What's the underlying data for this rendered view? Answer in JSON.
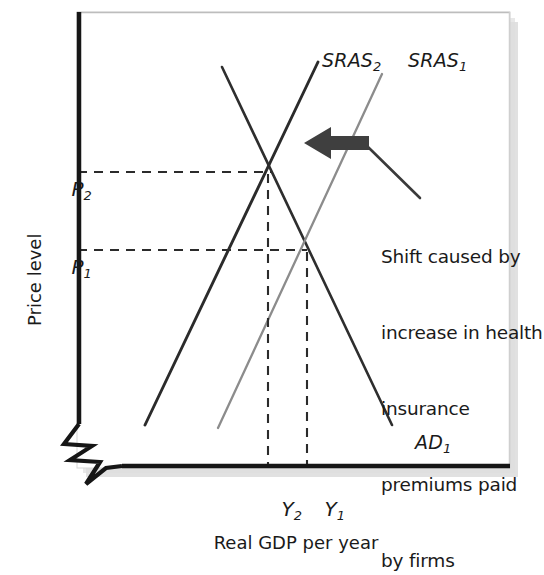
{
  "figure": {
    "background": "#ffffff",
    "panel": {
      "x": 77,
      "y": 12,
      "width": 433,
      "height": 456,
      "fill": "#ffffff"
    },
    "axis_color": "#161616",
    "shadow_color": "#b9b9b9"
  },
  "axes": {
    "y_title": "Price level",
    "x_title": "Real GDP per year",
    "y_ticks": [
      {
        "id": "P2",
        "base": "P",
        "sub": "2",
        "value_y": 172
      },
      {
        "id": "P1",
        "base": "P",
        "sub": "1",
        "value_y": 250
      }
    ],
    "x_ticks": [
      {
        "id": "Y2",
        "base": "Y",
        "sub": "2",
        "value_x": 268
      },
      {
        "id": "Y1",
        "base": "Y",
        "sub": "1",
        "value_x": 307
      }
    ],
    "break_symbol": "zigzag-axis-break"
  },
  "curves": [
    {
      "id": "AD1",
      "base": "AD",
      "sub": "1",
      "label": "AD1",
      "type": "aggregate-demand",
      "slope": "downward",
      "color": "#2e2e2e",
      "stroke_width": 2.6,
      "x1": 222,
      "y1": 67,
      "x2": 392,
      "y2": 425,
      "label_x": 392,
      "label_y": 436
    },
    {
      "id": "SRAS2",
      "base": "SRAS",
      "sub": "2",
      "label": "SRAS2",
      "type": "short-run-aggregate-supply",
      "slope": "upward",
      "color": "#2b2b2b",
      "stroke_width": 2.9,
      "x1": 145,
      "y1": 425,
      "x2": 318,
      "y2": 62,
      "label_x": 297,
      "label_y": 50
    },
    {
      "id": "SRAS1",
      "base": "SRAS",
      "sub": "1",
      "label": "SRAS1",
      "type": "short-run-aggregate-supply",
      "slope": "upward",
      "color": "#8c8c8c",
      "stroke_width": 2.3,
      "x1": 218,
      "y1": 428,
      "x2": 382,
      "y2": 74,
      "label_x": 383,
      "label_y": 50
    }
  ],
  "equilibria": [
    {
      "id": "E2",
      "x": 271,
      "y": 172,
      "price_label": "P2",
      "output_label": "Y2"
    },
    {
      "id": "E1",
      "x": 307,
      "y": 250,
      "price_label": "P1",
      "output_label": "Y1"
    }
  ],
  "guides": {
    "color": "#2b2b2b",
    "dash": "9,7",
    "horizontal": [
      {
        "from_x": 78,
        "to_x": 271,
        "y": 172
      },
      {
        "from_x": 78,
        "to_x": 307,
        "y": 250
      }
    ],
    "vertical": [
      {
        "x": 268,
        "from_y": 172,
        "to_y": 468
      },
      {
        "x": 307,
        "from_y": 250,
        "to_y": 468
      }
    ]
  },
  "annotation": {
    "arrow": {
      "name": "shift-arrow",
      "direction": "left",
      "color": "#3a3a3a",
      "tail_x": 368,
      "head_x": 304,
      "y": 143
    },
    "leader_line": {
      "x1": 368,
      "y1": 145,
      "x2": 419,
      "y2": 196,
      "color": "#3a3a3a"
    },
    "text_lines": [
      "Shift caused by",
      "increase in health",
      "insurance",
      "premiums paid",
      "by firms"
    ],
    "text_x": 381,
    "text_y": 200
  }
}
